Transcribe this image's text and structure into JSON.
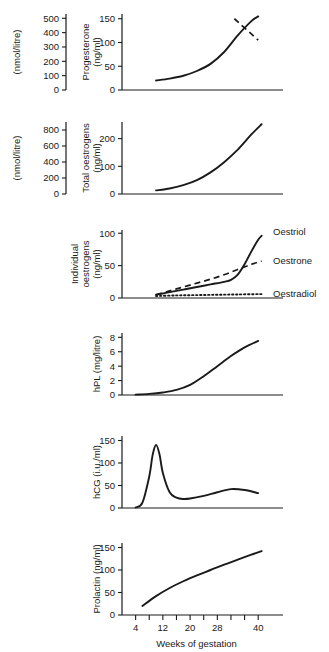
{
  "figure": {
    "xaxis": {
      "title": "Weeks of gestation",
      "min": 0,
      "max": 42,
      "tick_step": 4,
      "ticks": [
        4,
        8,
        12,
        16,
        20,
        24,
        28,
        32,
        36,
        40
      ],
      "tick_labels": [
        "4",
        "",
        "12",
        "",
        "20",
        "",
        "28",
        "",
        "",
        "40"
      ]
    },
    "panels": [
      {
        "id": "progesterone",
        "inner_axis_title": "Progesterone\n(ng/ml)",
        "inner_axis_title_line1": "Progesterone",
        "inner_axis_title_line2": "(ng/ml)",
        "inner_ticks": [
          "0",
          "50",
          "100",
          "150"
        ],
        "outer_axis_title": "(nmol/litre)",
        "outer_ticks": [
          "0",
          "100",
          "200",
          "300",
          "400",
          "500"
        ],
        "series_labels": []
      },
      {
        "id": "total-oestrogens",
        "inner_axis_title_line1": "Total oestrogens",
        "inner_axis_title_line2": "(ng/ml)",
        "inner_ticks": [
          "0",
          "100",
          "200"
        ],
        "outer_axis_title": "(nmol/litre)",
        "outer_ticks": [
          "0",
          "200",
          "400",
          "600",
          "800"
        ],
        "series_labels": []
      },
      {
        "id": "individual-oestrogens",
        "inner_axis_title_line1": "Individual",
        "inner_axis_title_line2": "oestrogens",
        "inner_axis_title_line3": "(ng/ml)",
        "inner_ticks": [
          "0",
          "50",
          "100"
        ],
        "outer_axis_title": "",
        "outer_ticks": [],
        "series_labels": [
          "Oestriol",
          "Oestrone",
          "Oestradiol"
        ]
      },
      {
        "id": "hpl",
        "inner_axis_title_line1": "hPL (mg/litre)",
        "inner_ticks": [
          "0",
          "2",
          "4",
          "6",
          "8"
        ],
        "outer_axis_title": "",
        "outer_ticks": [],
        "series_labels": []
      },
      {
        "id": "hcg",
        "inner_axis_title_line1": "hCG (i.u./ml)",
        "inner_ticks": [
          "0",
          "50",
          "100",
          "150"
        ],
        "outer_axis_title": "",
        "outer_ticks": [],
        "series_labels": []
      },
      {
        "id": "prolactin",
        "inner_axis_title_line1": "Prolactin (ng/ml)",
        "inner_ticks": [
          "0",
          "50",
          "100",
          "150"
        ],
        "outer_axis_title": "",
        "outer_ticks": [],
        "series_labels": []
      }
    ]
  },
  "chart_data": [
    {
      "type": "line",
      "title": "Progesterone",
      "xlabel": "Weeks of gestation",
      "ylabel": "Progesterone (ng/ml)",
      "ylabel_secondary": "(nmol/litre)",
      "xlim": [
        0,
        42
      ],
      "ylim": [
        0,
        160
      ],
      "ylim_secondary": [
        0,
        530
      ],
      "yticks": [
        0,
        50,
        100,
        150
      ],
      "yticks_secondary": [
        0,
        100,
        200,
        300,
        400,
        500
      ],
      "grid": false,
      "series": [
        {
          "name": "Progesterone",
          "style": "solid",
          "x": [
            10,
            14,
            18,
            22,
            26,
            30,
            34,
            38,
            40
          ],
          "values": [
            20,
            24,
            30,
            40,
            55,
            80,
            115,
            145,
            155
          ]
        },
        {
          "name": "term-marker",
          "style": "dashed",
          "x": [
            33,
            40
          ],
          "values": [
            150,
            105
          ]
        }
      ]
    },
    {
      "type": "line",
      "title": "Total oestrogens",
      "xlabel": "Weeks of gestation",
      "ylabel": "Total oestrogens (ng/ml)",
      "ylabel_secondary": "(nmol/litre)",
      "xlim": [
        0,
        42
      ],
      "ylim": [
        0,
        260
      ],
      "ylim_secondary": [
        0,
        900
      ],
      "yticks": [
        0,
        100,
        200
      ],
      "yticks_secondary": [
        0,
        200,
        400,
        600,
        800
      ],
      "grid": false,
      "series": [
        {
          "name": "Total oestrogens",
          "style": "solid",
          "x": [
            10,
            14,
            18,
            22,
            26,
            30,
            34,
            38,
            41
          ],
          "values": [
            13,
            20,
            32,
            50,
            78,
            115,
            160,
            215,
            252
          ]
        }
      ]
    },
    {
      "type": "line",
      "title": "Individual oestrogens",
      "xlabel": "Weeks of gestation",
      "ylabel": "Individual oestrogens (ng/ml)",
      "xlim": [
        0,
        42
      ],
      "ylim": [
        0,
        105
      ],
      "yticks": [
        0,
        50,
        100
      ],
      "grid": false,
      "legend_position": "right",
      "series": [
        {
          "name": "Oestriol",
          "style": "solid",
          "x": [
            10,
            14,
            18,
            22,
            26,
            30,
            32,
            34,
            36,
            38,
            40,
            41
          ],
          "values": [
            5,
            9,
            13,
            17,
            21,
            25,
            28,
            36,
            52,
            72,
            90,
            96
          ]
        },
        {
          "name": "Oestrone",
          "style": "dashed",
          "x": [
            10,
            14,
            18,
            22,
            26,
            30,
            34,
            38,
            41
          ],
          "values": [
            5,
            11,
            17,
            23,
            29,
            36,
            44,
            52,
            57
          ]
        },
        {
          "name": "Oestradiol",
          "style": "dotted",
          "x": [
            10,
            16,
            22,
            28,
            34,
            40,
            41
          ],
          "values": [
            3,
            4,
            4.5,
            5,
            5.5,
            6,
            6
          ]
        }
      ]
    },
    {
      "type": "line",
      "title": "hPL",
      "xlabel": "Weeks of gestation",
      "ylabel": "hPL (mg/litre)",
      "xlim": [
        0,
        42
      ],
      "ylim": [
        0,
        8.6
      ],
      "yticks": [
        0,
        2,
        4,
        6,
        8
      ],
      "grid": false,
      "series": [
        {
          "name": "hPL",
          "style": "solid",
          "x": [
            4,
            8,
            12,
            16,
            20,
            24,
            28,
            32,
            36,
            40
          ],
          "values": [
            0.05,
            0.15,
            0.35,
            0.7,
            1.4,
            2.6,
            4.0,
            5.4,
            6.6,
            7.5
          ]
        }
      ]
    },
    {
      "type": "line",
      "title": "hCG",
      "xlabel": "Weeks of gestation",
      "ylabel": "hCG (i.u./ml)",
      "xlim": [
        0,
        42
      ],
      "ylim": [
        0,
        160
      ],
      "yticks": [
        0,
        50,
        100,
        150
      ],
      "grid": false,
      "series": [
        {
          "name": "hCG",
          "style": "solid",
          "x": [
            4,
            6,
            8,
            9,
            10,
            11,
            12,
            14,
            16,
            18,
            20,
            24,
            28,
            32,
            36,
            40
          ],
          "values": [
            1,
            12,
            70,
            118,
            140,
            120,
            78,
            35,
            23,
            20,
            21,
            27,
            35,
            42,
            40,
            33
          ]
        }
      ]
    },
    {
      "type": "line",
      "title": "Prolactin",
      "xlabel": "Weeks of gestation",
      "ylabel": "Prolactin (ng/ml)",
      "xlim": [
        0,
        42
      ],
      "ylim": [
        0,
        160
      ],
      "yticks": [
        0,
        50,
        100,
        150
      ],
      "grid": false,
      "series": [
        {
          "name": "Prolactin",
          "style": "solid",
          "x": [
            6,
            10,
            14,
            18,
            22,
            26,
            30,
            34,
            38,
            41
          ],
          "values": [
            20,
            42,
            60,
            75,
            88,
            100,
            112,
            123,
            134,
            142
          ]
        }
      ]
    }
  ]
}
